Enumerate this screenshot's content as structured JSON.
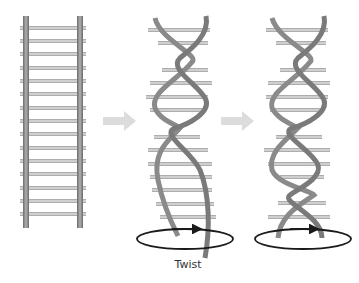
{
  "figure": {
    "panels": [
      {
        "name": "straight-ladder",
        "description": "untwisted ladder"
      },
      {
        "name": "partially-twisted-helix",
        "description": "ladder twisted into helix with rotation arrow"
      },
      {
        "name": "fully-twisted-helix",
        "description": "more tightly twisted helix with rotation arrow"
      }
    ],
    "caption": "Twist",
    "colors": {
      "rail": "#8a8a8a",
      "rail_dark": "#5e5e5e",
      "rung": "#c8c8c8",
      "rung_edge": "#9a9a9a",
      "arrow": "#dcdcdc",
      "rotation": "#1a1a1a"
    },
    "icons": [
      "right-arrow-icon",
      "right-arrow-icon",
      "rotation-ellipse-icon",
      "rotation-ellipse-icon"
    ]
  }
}
